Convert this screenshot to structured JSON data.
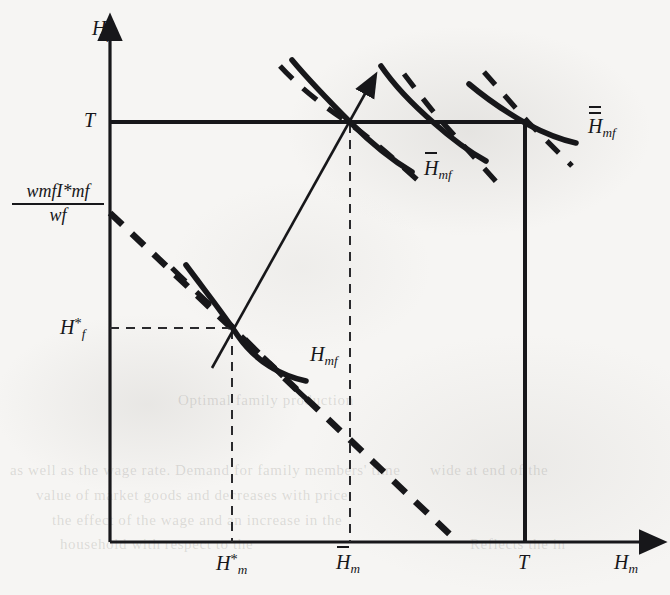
{
  "figure": {
    "type": "economics-indifference-curve-diagram",
    "background_color": "#f6f5f3",
    "ink_color": "#17171a",
    "axes": {
      "y_axis_label": "H",
      "y_axis_sub": "f",
      "x_axis_label": "H",
      "x_axis_sub": "m",
      "origin_px": [
        110,
        542
      ],
      "y_axis_top_px": 28,
      "x_axis_right_px": 650
    },
    "y_ticks": [
      {
        "id": "T-level",
        "label": "T",
        "sub": "",
        "y_px": 122
      },
      {
        "id": "budget-intercept",
        "label": "fraction",
        "y_px": 213
      },
      {
        "id": "Hf-star",
        "label": "H",
        "sub": "f",
        "sup": "*",
        "y_px": 328
      }
    ],
    "x_ticks": [
      {
        "id": "Hm-star",
        "label": "H",
        "sub": "m",
        "sup": "*",
        "bar": "none",
        "x_px": 232
      },
      {
        "id": "Hm-bar",
        "label": "H",
        "sub": "m",
        "sup": "",
        "bar": "single",
        "x_px": 350
      },
      {
        "id": "T-x",
        "label": "T",
        "sub": "",
        "sup": "",
        "bar": "none",
        "x_px": 525
      }
    ],
    "intercept_fraction": {
      "numerator_w": "w",
      "numerator_w_sub": "mf",
      "numerator_I": "I",
      "numerator_I_sub": "mf",
      "numerator_I_sup": "*",
      "denominator_w": "w",
      "denominator_w_sub": "f"
    },
    "curve_labels": [
      {
        "id": "Hmf-plain",
        "label": "H",
        "sub": "mf",
        "bar": "none",
        "x_px": 310,
        "y_px": 352
      },
      {
        "id": "Hmf-bar",
        "label": "H",
        "sub": "mf",
        "bar": "single",
        "x_px": 424,
        "y_px": 160
      },
      {
        "id": "Hmf-dblbar",
        "label": "H",
        "sub": "mf",
        "bar": "double",
        "x_px": 573,
        "y_px": 118
      }
    ],
    "lines": {
      "t_horizontal": {
        "from_px": [
          110,
          122
        ],
        "to_px": [
          525,
          122
        ],
        "style": "solid-thick"
      },
      "t_vertical": {
        "from_px": [
          525,
          122
        ],
        "to_px": [
          525,
          542
        ],
        "style": "solid-thick"
      },
      "budget_line": {
        "from_px": [
          110,
          213
        ],
        "to_px": [
          458,
          542
        ],
        "style": "dashed-thick"
      },
      "expansion_path": {
        "from_px": [
          212,
          368
        ],
        "to_px": [
          368,
          88
        ],
        "style": "solid-thin",
        "arrow": "up-right"
      },
      "guide_vertical_Hm_star": {
        "from_px": [
          232,
          328
        ],
        "to_px": [
          232,
          542
        ],
        "style": "dashed-thin"
      },
      "guide_horizontal_Hf_star": {
        "from_px": [
          110,
          328
        ],
        "to_px": [
          232,
          328
        ],
        "style": "dashed-thin"
      },
      "guide_vertical_Hm_bar": {
        "from_px": [
          350,
          122
        ],
        "to_px": [
          350,
          542
        ],
        "style": "dashed-thin"
      }
    },
    "indifference_curves": [
      {
        "id": "curve-Hmf",
        "tangency_px": [
          232,
          328
        ],
        "style": "solid-thick"
      },
      {
        "id": "curve-Hmf-low",
        "tangency_px": [
          232,
          328
        ],
        "style": "dashed-thick"
      },
      {
        "id": "curve-Hmf-bar-1",
        "tangency_px": [
          350,
          122
        ],
        "style": "solid-thick"
      },
      {
        "id": "curve-Hmf-bar-1d",
        "tangency_px": [
          350,
          122
        ],
        "style": "dashed-thick"
      },
      {
        "id": "curve-Hmf-bar-2",
        "tangency_px": [
          435,
          122
        ],
        "style": "solid-thick"
      },
      {
        "id": "curve-Hmf-bar-2d",
        "tangency_px": [
          435,
          122
        ],
        "style": "dashed-thick"
      },
      {
        "id": "curve-Hmf-dbl",
        "tangency_px": [
          525,
          122
        ],
        "style": "solid-thick"
      },
      {
        "id": "curve-Hmf-dbl-d",
        "tangency_px": [
          525,
          122
        ],
        "style": "dashed-thick"
      }
    ]
  },
  "ghost_text": [
    {
      "text": "Optimal family production",
      "x_px": 178,
      "y_px": 392
    },
    {
      "text": "as well as the wage rate. Demand for family members' time",
      "x_px": 10,
      "y_px": 462
    },
    {
      "text": "value of market goods and decreases with price",
      "x_px": 36,
      "y_px": 487
    },
    {
      "text": "the effect of the wage and an increase in the",
      "x_px": 52,
      "y_px": 512
    },
    {
      "text": "household with respect to the",
      "x_px": 60,
      "y_px": 536
    },
    {
      "text": "Reflects the in",
      "x_px": 470,
      "y_px": 536
    },
    {
      "text": "wide at end of the",
      "x_px": 430,
      "y_px": 462
    }
  ]
}
